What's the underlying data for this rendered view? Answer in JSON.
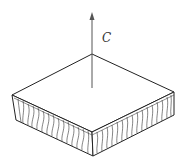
{
  "diagram": {
    "axis": {
      "label": "C",
      "color": "#555555"
    },
    "panel": {
      "stroke_color": "#222222",
      "fill_color": "#ffffff",
      "core_pattern": "vertical corrugated cells"
    }
  }
}
